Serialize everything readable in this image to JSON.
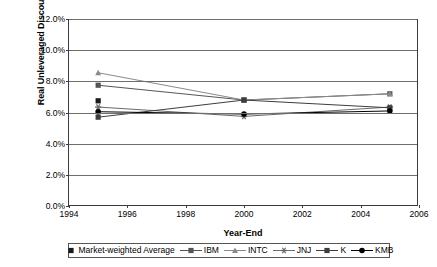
{
  "chart_data": {
    "type": "line",
    "title": "",
    "xlabel": "Year-End",
    "ylabel": "Real Unleveraged Discount Rates",
    "x": [
      1995,
      2000,
      2005
    ],
    "xlim": [
      1994,
      2006
    ],
    "ylim": [
      0.0,
      12.0
    ],
    "xticks": [
      "1994",
      "1996",
      "1998",
      "2000",
      "2002",
      "2004",
      "2006"
    ],
    "xtick_values": [
      1994,
      1996,
      1998,
      2000,
      2002,
      2004,
      2006
    ],
    "yticks": [
      "0.0%",
      "2.0%",
      "4.0%",
      "6.0%",
      "8.0%",
      "10.0%",
      "12.0%"
    ],
    "ytick_values": [
      0.0,
      2.0,
      4.0,
      6.0,
      8.0,
      10.0,
      12.0
    ],
    "grid": "horizontal",
    "legend_position": "bottom",
    "series": [
      {
        "name": "Market-weighted Average",
        "marker": "square",
        "line": "none",
        "color": "#1a1a1a",
        "values": [
          6.75,
          null,
          null
        ]
      },
      {
        "name": "IBM",
        "marker": "square",
        "line": "solid",
        "color": "#555555",
        "values": [
          7.75,
          6.8,
          7.2
        ]
      },
      {
        "name": "INTC",
        "marker": "triangle",
        "line": "solid",
        "color": "#8a8a8a",
        "values": [
          8.55,
          6.8,
          7.2
        ]
      },
      {
        "name": "JNJ",
        "marker": "star",
        "line": "solid",
        "color": "#6a6a6a",
        "values": [
          6.35,
          5.75,
          6.35
        ]
      },
      {
        "name": "K",
        "marker": "square",
        "line": "solid",
        "color": "#3d3d3d",
        "values": [
          5.7,
          6.8,
          6.3
        ]
      },
      {
        "name": "KMB",
        "marker": "circle",
        "line": "solid",
        "color": "#000000",
        "values": [
          6.05,
          5.9,
          6.1
        ]
      }
    ]
  },
  "axes": {
    "ylabel": "Real Unleveraged Discount Rates",
    "xlabel": "Year-End"
  },
  "legend": {
    "items": [
      {
        "label": "Market-weighted Average"
      },
      {
        "label": "IBM"
      },
      {
        "label": "INTC"
      },
      {
        "label": "JNJ"
      },
      {
        "label": "K"
      },
      {
        "label": "KMB"
      }
    ]
  }
}
